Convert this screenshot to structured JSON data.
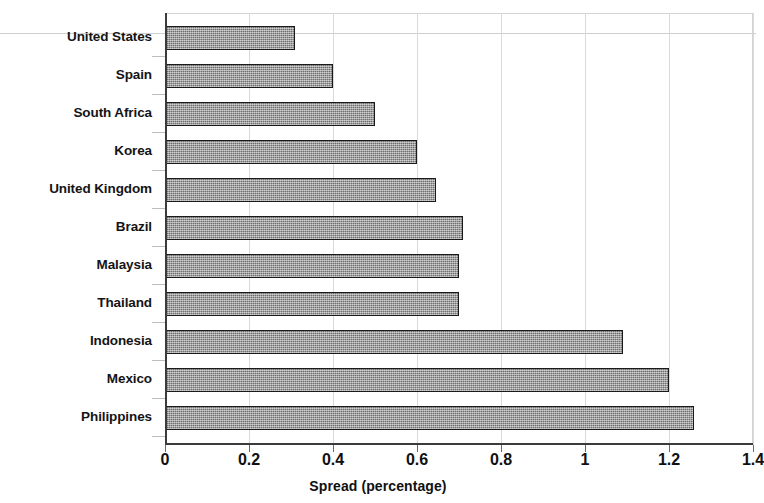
{
  "chart_data": {
    "type": "bar",
    "orientation": "horizontal",
    "title": "",
    "xlabel": "Spread (percentage)",
    "ylabel": "",
    "xlim": [
      0,
      1.4
    ],
    "xticks": [
      "0",
      "0.2",
      "0.4",
      "0.6",
      "0.8",
      "1",
      "1.2",
      "1.4"
    ],
    "xtick_values": [
      0,
      0.2,
      0.4,
      0.6,
      0.8,
      1,
      1.2,
      1.4
    ],
    "grid": "vertical",
    "legend": "none",
    "bar_color": "#8d8d8d",
    "bar_edge_color": "#1a1a1a",
    "categories": [
      "United States",
      "Spain",
      "South Africa",
      "Korea",
      "United Kingdom",
      "Brazil",
      "Malaysia",
      "Thailand",
      "Indonesia",
      "Mexico",
      "Philippines"
    ],
    "values": [
      0.31,
      0.4,
      0.5,
      0.6,
      0.645,
      0.71,
      0.7,
      0.7,
      1.09,
      1.2,
      1.26
    ]
  }
}
